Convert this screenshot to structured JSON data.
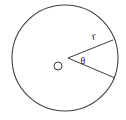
{
  "figure": {
    "kind": "circle-sector-geometry-diagram",
    "background_color": "#ffffff",
    "stroke_color": "#3c3c3c",
    "label_color": "#1a1a1a",
    "circle": {
      "center_x": 65,
      "center_y": 58,
      "radius": 53
    },
    "center_marker": {
      "label": "O",
      "x": 58,
      "y": 66,
      "radius": 4
    },
    "sector": {
      "apex_x": 68,
      "apex_y": 58,
      "upper_radius_end_x": 113,
      "upper_radius_end_y": 40,
      "lower_radius_end_x": 115,
      "lower_radius_end_y": 78
    },
    "labels": {
      "radius": "r",
      "angle": "θ"
    },
    "label_positions": {
      "radius_x": 94,
      "radius_y": 37,
      "angle_x": 83,
      "angle_y": 62
    }
  }
}
